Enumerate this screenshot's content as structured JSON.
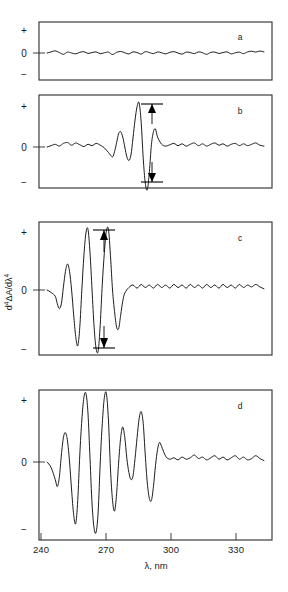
{
  "figure": {
    "panel_letters": [
      "a",
      "b",
      "c",
      "d"
    ],
    "y_axis_label": "d4ΔA/dλ4",
    "y_axis_label_parts": {
      "d": "d",
      "sup1": "4",
      "delta_a": "ΔA/d",
      "lambda": "λ",
      "sup2": "4"
    },
    "y_tick_labels": [
      "+",
      "0",
      "−"
    ],
    "x_axis_label": "λ, nm",
    "x_tick_labels": [
      "240",
      "270",
      "300",
      "330"
    ],
    "colors": {
      "trace": "#111111",
      "frame": "#2b2b2b",
      "background": "#ffffff",
      "arrow": "#000000"
    }
  },
  "chart_data": {
    "type": "line",
    "xlabel": "λ, nm",
    "ylabel": "d4ΔA/dλ4",
    "xlim": [
      240,
      348
    ],
    "ylim": [
      -1,
      1
    ],
    "xticks": [
      240,
      270,
      300,
      330
    ],
    "yticks": [
      "+",
      "0",
      "−"
    ],
    "grid": false,
    "legend": "none",
    "panel_layout": "4 stacked panels sharing the x axis",
    "annotations": [
      {
        "panel": "b",
        "type": "peak-to-trough-arrows",
        "x": 286,
        "direction": "up-and-down"
      },
      {
        "panel": "c",
        "type": "peak-to-trough-arrows",
        "x": 269,
        "direction": "up-and-down"
      }
    ],
    "panels": [
      {
        "label": "a",
        "description": "baseline noise only, flat near zero across full range",
        "x": [
          241,
          243,
          245,
          247,
          249,
          251,
          253,
          255,
          257,
          259,
          261,
          263,
          265,
          267,
          269,
          271,
          273,
          275,
          277,
          279,
          281,
          283,
          285,
          287,
          289,
          291,
          293,
          295,
          297,
          299,
          301,
          303,
          305,
          307,
          309,
          311,
          313,
          315,
          317,
          319,
          321,
          323,
          325,
          327,
          329,
          331,
          333,
          335,
          337,
          339,
          341,
          343,
          345,
          347
        ],
        "y": [
          0.0,
          0.05,
          0.1,
          0.02,
          -0.06,
          0.04,
          0.0,
          -0.04,
          0.03,
          0.06,
          -0.02,
          0.02,
          0.05,
          -0.03,
          0.01,
          0.04,
          -0.07,
          0.03,
          0.07,
          0.01,
          -0.04,
          0.05,
          0.02,
          -0.05,
          0.06,
          0.02,
          -0.03,
          0.05,
          0.01,
          -0.04,
          0.03,
          0.06,
          0.0,
          -0.05,
          0.04,
          0.02,
          -0.03,
          0.05,
          0.01,
          -0.06,
          0.03,
          0.04,
          -0.02,
          0.02,
          0.05,
          -0.04,
          0.01,
          0.04,
          -0.03,
          0.05,
          0.08,
          0.04,
          0.09,
          0.05
        ]
      },
      {
        "label": "b",
        "description": "low-amplitude derivative band; strongest oscillation between 282 and 292 nm with positive peak then deep negative trough",
        "peak_x": 286,
        "trough_x": 289,
        "x": [
          241,
          243,
          245,
          247,
          249,
          251,
          253,
          255,
          257,
          259,
          261,
          263,
          265,
          267,
          269,
          271,
          273,
          274,
          275,
          276,
          277,
          278,
          279,
          280,
          281,
          282,
          283,
          284,
          285,
          286,
          287,
          288,
          289,
          290,
          291,
          292,
          293,
          294,
          295,
          297,
          299,
          301,
          303,
          305,
          307,
          309,
          311,
          313,
          315,
          317,
          319,
          321,
          323,
          325,
          327,
          329,
          331,
          333,
          335,
          337,
          339,
          341,
          343,
          345,
          347
        ],
        "y": [
          0.0,
          0.03,
          0.06,
          0.02,
          0.08,
          0.1,
          0.04,
          0.09,
          0.05,
          0.01,
          0.06,
          0.03,
          0.08,
          0.04,
          -0.02,
          -0.12,
          -0.22,
          -0.1,
          0.1,
          0.3,
          0.34,
          0.22,
          0.0,
          -0.22,
          -0.3,
          -0.18,
          0.2,
          0.6,
          0.9,
          0.98,
          0.55,
          -0.25,
          -0.8,
          -0.95,
          -0.55,
          0.05,
          0.34,
          0.4,
          0.22,
          0.06,
          0.02,
          0.05,
          0.08,
          0.03,
          0.07,
          0.02,
          0.06,
          0.09,
          0.03,
          0.07,
          0.02,
          0.06,
          0.09,
          0.04,
          0.07,
          0.02,
          0.06,
          0.08,
          0.03,
          0.07,
          0.03,
          0.06,
          0.09,
          0.04,
          0.02
        ]
      },
      {
        "label": "c",
        "description": "large-amplitude oscillating derivative band from 246 to 276 nm; flat noise beyond 280 nm",
        "peak_x": 265,
        "trough_x": 269,
        "x": [
          241,
          243,
          245,
          246,
          247,
          248,
          249,
          250,
          251,
          252,
          253,
          254,
          255,
          256,
          257,
          258,
          259,
          260,
          261,
          262,
          263,
          264,
          265,
          266,
          267,
          268,
          269,
          270,
          271,
          272,
          273,
          274,
          275,
          276,
          277,
          278,
          279,
          281,
          283,
          285,
          287,
          289,
          291,
          293,
          295,
          297,
          299,
          301,
          303,
          305,
          307,
          309,
          311,
          313,
          315,
          317,
          319,
          321,
          323,
          325,
          327,
          329,
          331,
          333,
          335,
          337,
          339,
          341,
          343,
          345,
          347
        ],
        "y": [
          0.0,
          -0.04,
          -0.1,
          -0.22,
          -0.3,
          -0.22,
          0.05,
          0.3,
          0.42,
          0.3,
          0.0,
          -0.4,
          -0.75,
          -0.9,
          -0.6,
          0.0,
          0.55,
          0.92,
          0.98,
          0.6,
          0.0,
          -0.6,
          -0.95,
          -0.98,
          -0.55,
          0.1,
          0.6,
          0.95,
          0.98,
          0.55,
          0.0,
          -0.35,
          -0.6,
          -0.62,
          -0.4,
          -0.18,
          -0.05,
          0.04,
          0.08,
          0.03,
          0.09,
          0.04,
          0.08,
          0.03,
          0.09,
          0.04,
          0.08,
          0.03,
          0.09,
          0.04,
          0.08,
          0.03,
          0.09,
          0.04,
          0.08,
          0.03,
          0.09,
          0.04,
          0.08,
          0.03,
          0.09,
          0.04,
          0.08,
          0.03,
          0.09,
          0.04,
          0.08,
          0.05,
          0.09,
          0.05,
          0.02
        ]
      },
      {
        "label": "d",
        "description": "full fourth-derivative difference spectrum with strong structure from 245 to 295 nm and flat baseline beyond 300 nm",
        "x": [
          241,
          243,
          245,
          246,
          247,
          248,
          249,
          250,
          251,
          252,
          253,
          254,
          255,
          256,
          257,
          258,
          259,
          260,
          261,
          262,
          263,
          264,
          265,
          266,
          267,
          268,
          269,
          270,
          271,
          272,
          273,
          274,
          275,
          276,
          277,
          278,
          279,
          280,
          281,
          282,
          283,
          284,
          285,
          286,
          287,
          288,
          289,
          290,
          291,
          292,
          293,
          294,
          295,
          296,
          297,
          299,
          301,
          303,
          305,
          307,
          309,
          311,
          313,
          315,
          317,
          319,
          321,
          323,
          325,
          327,
          329,
          331,
          333,
          335,
          337,
          339,
          341,
          343,
          345,
          347
        ],
        "y": [
          0.0,
          -0.08,
          -0.25,
          -0.35,
          -0.22,
          0.1,
          0.35,
          0.42,
          0.3,
          0.0,
          -0.4,
          -0.75,
          -0.88,
          -0.55,
          0.1,
          0.6,
          0.92,
          0.98,
          0.7,
          0.05,
          -0.6,
          -0.95,
          -1.0,
          -0.7,
          0.0,
          0.55,
          0.92,
          0.98,
          0.6,
          -0.1,
          -0.55,
          -0.7,
          -0.45,
          0.0,
          0.35,
          0.5,
          0.35,
          0.05,
          -0.15,
          -0.25,
          -0.2,
          0.05,
          0.35,
          0.62,
          0.72,
          0.55,
          0.1,
          -0.3,
          -0.52,
          -0.55,
          -0.35,
          -0.05,
          0.18,
          0.28,
          0.22,
          0.08,
          0.04,
          0.06,
          0.03,
          0.07,
          0.04,
          0.06,
          0.1,
          0.05,
          0.07,
          0.03,
          0.06,
          0.09,
          0.04,
          0.07,
          0.03,
          0.06,
          0.09,
          0.04,
          0.07,
          0.03,
          0.05,
          0.09,
          0.05,
          0.02
        ]
      }
    ]
  }
}
